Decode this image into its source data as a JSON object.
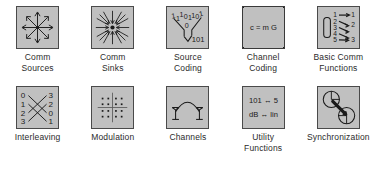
{
  "palette": {
    "background_color": "#ffffff",
    "icon_fill": "#c0c0c0",
    "icon_border": "#4a4a4a",
    "ink_color": "#1a1a1a",
    "rows": [
      {
        "cells": [
          {
            "icon": "radiating-arrows-icon",
            "label_line1": "Comm",
            "label_line2": "Sources",
            "selected": false
          },
          {
            "icon": "converging-arrows-icon",
            "label_line1": "Comm",
            "label_line2": "Sinks",
            "selected": false
          },
          {
            "icon": "source-coding-funnel-icon",
            "label_line1": "Source",
            "label_line2": "Coding",
            "selected": false,
            "glyphs": {
              "top_bits": [
                "1",
                "1",
                "1",
                "0",
                "1",
                "1",
                "0",
                "1"
              ],
              "middle_bit": "0",
              "bottom_bits": "101"
            }
          },
          {
            "icon": "channel-coding-formula-icon",
            "label_line1": "Channel",
            "label_line2": "Coding",
            "selected": true,
            "glyphs": {
              "formula": "c = m G"
            }
          },
          {
            "icon": "basic-comm-functions-mapping-icon",
            "label_line1": "Basic Comm",
            "label_line2": "Functions",
            "selected": false,
            "glyphs": {
              "left_numbers": [
                "1",
                "2",
                "3",
                "4",
                "5"
              ],
              "right_numbers": [
                "1",
                "2",
                "3"
              ]
            }
          }
        ]
      },
      {
        "cells": [
          {
            "icon": "interleaving-crossing-icon",
            "label_line1": "Interleaving",
            "label_line2": "",
            "selected": false,
            "glyphs": {
              "left_numbers": [
                "0",
                "1",
                "2",
                "3"
              ],
              "right_numbers": [
                "3",
                "2",
                "0",
                "1"
              ]
            }
          },
          {
            "icon": "modulation-constellation-icon",
            "label_line1": "Modulation",
            "label_line2": "",
            "selected": false
          },
          {
            "icon": "channels-antenna-arc-icon",
            "label_line1": "Channels",
            "label_line2": "",
            "selected": false
          },
          {
            "icon": "utility-functions-conversion-icon",
            "label_line1": "Utility",
            "label_line2": "Functions",
            "selected": false,
            "glyphs": {
              "line1": "101 ↔ 5",
              "line2": "dB ↔ lin"
            }
          },
          {
            "icon": "synchronization-clocks-icon",
            "label_line1": "Synchronization",
            "label_line2": "",
            "selected": false
          }
        ]
      }
    ]
  }
}
